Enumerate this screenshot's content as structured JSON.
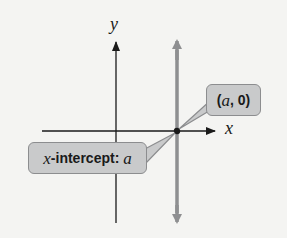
{
  "diagram": {
    "axes": {
      "x_label": "x",
      "y_label": "y"
    },
    "vertical_line": {
      "description": "vertical line x = a",
      "color": "#8e8f91"
    },
    "point": {
      "label_var": "a",
      "label_text": "(a, 0)",
      "label_open": "(",
      "label_sep": ", ",
      "label_zero": "0",
      "label_close": ")"
    },
    "intercept_callout": {
      "prefix_var": "x",
      "text": "-intercept: ",
      "value_var": "a"
    },
    "colors": {
      "background": "#f4f4f2",
      "axis": "#1a1a1a",
      "callout_fill": "#c9cacb",
      "callout_border": "#8c8d8f"
    }
  }
}
